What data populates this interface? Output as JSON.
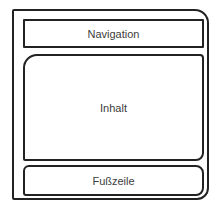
{
  "diagram": {
    "type": "page-layout-wireframe",
    "sections": [
      {
        "id": "navigation",
        "label": "Navigation"
      },
      {
        "id": "content",
        "label": "Inhalt"
      },
      {
        "id": "footer",
        "label": "Fußzeile"
      }
    ]
  }
}
